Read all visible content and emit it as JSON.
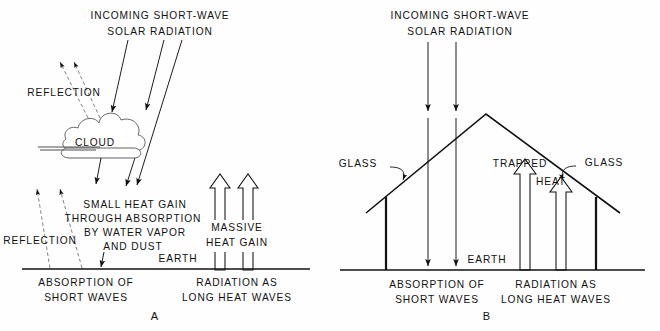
{
  "figure": {
    "background_color": "#fefefe",
    "ink_color": "#111111"
  },
  "panels": [
    {
      "id": "A",
      "letter": "A",
      "name": "atmosphere-greenhouse-effect",
      "heading_line1": "INCOMING SHORT-WAVE",
      "heading_line2": "SOLAR RADIATION",
      "labels": {
        "reflection_upper": "REFLECTION",
        "cloud": "CLOUD",
        "reflection_lower": "REFLECTION",
        "center_line1": "SMALL HEAT GAIN",
        "center_line2": "THROUGH ABSORPTION",
        "center_line3": "BY WATER VAPOR",
        "center_line4": "AND DUST",
        "massive_line1": "MASSIVE",
        "massive_line2": "HEAT GAIN",
        "earth": "EARTH",
        "bottom_left_line1": "ABSORPTION OF",
        "bottom_left_line2": "SHORT WAVES",
        "bottom_right_line1": "RADIATION AS",
        "bottom_right_line2": "LONG HEAT WAVES"
      }
    },
    {
      "id": "B",
      "letter": "B",
      "name": "glasshouse-greenhouse-effect",
      "heading_line1": "INCOMING SHORT-WAVE",
      "heading_line2": "SOLAR RADIATION",
      "labels": {
        "glass_left": "GLASS",
        "glass_right": "GLASS",
        "trapped": "TRAPPED",
        "heat": "HEAT",
        "earth": "EARTH",
        "bottom_left_line1": "ABSORPTION OF",
        "bottom_left_line2": "SHORT WAVES",
        "bottom_right_line1": "RADIATION AS",
        "bottom_right_line2": "LONG HEAT WAVES"
      }
    }
  ]
}
